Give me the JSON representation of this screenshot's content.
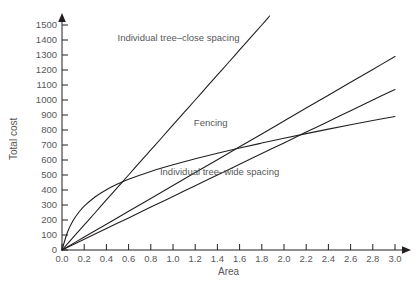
{
  "chart_data": {
    "type": "line",
    "title": "",
    "xlabel": "Area",
    "ylabel": "Total cost",
    "xlim": [
      0.0,
      3.0
    ],
    "ylim": [
      0,
      1500
    ],
    "grid": false,
    "legend_position": "inline-annotations",
    "xticks": [
      "0.0",
      "0.2",
      "0.4",
      "0.6",
      "0.8",
      "1.0",
      "1.2",
      "1.4",
      "1.6",
      "1.8",
      "2.0",
      "2.2",
      "2.4",
      "2.6",
      "2.8",
      "3.0"
    ],
    "xtick_values": [
      0.0,
      0.2,
      0.4,
      0.6,
      0.8,
      1.0,
      1.2,
      1.4,
      1.6,
      1.8,
      2.0,
      2.2,
      2.4,
      2.6,
      2.8,
      3.0
    ],
    "yticks": [
      "0",
      "100",
      "200",
      "300",
      "400",
      "500",
      "600",
      "700",
      "800",
      "900",
      "1000",
      "1100",
      "1200",
      "1300",
      "1400",
      "1500"
    ],
    "ytick_values": [
      0,
      100,
      200,
      300,
      400,
      500,
      600,
      700,
      800,
      900,
      1000,
      1100,
      1200,
      1300,
      1400,
      1500
    ],
    "line_color": "#231f20",
    "text_color": "#58585a",
    "series": [
      {
        "name": "Individual tree-close spacing",
        "label": "Individual tree–close spacing",
        "label_x": 1.05,
        "label_y": 1395,
        "x": [
          0.0,
          0.1,
          0.2,
          0.3,
          0.4,
          0.5,
          0.6,
          0.7,
          0.8,
          0.9,
          1.0,
          1.1,
          1.2,
          1.3,
          1.4,
          1.5,
          1.6,
          1.7,
          1.8,
          1.87
        ],
        "values": [
          0,
          84,
          167,
          250,
          334,
          417,
          500,
          584,
          667,
          750,
          834,
          917,
          1000,
          1084,
          1167,
          1250,
          1334,
          1417,
          1500,
          1560
        ]
      },
      {
        "name": "Fencing",
        "label": "Fencing",
        "label_x": 1.34,
        "label_y": 825,
        "x": [
          0.0,
          0.2,
          0.4,
          0.6,
          0.8,
          1.0,
          1.2,
          1.4,
          1.6,
          1.8,
          2.0,
          2.2,
          2.4,
          2.6,
          2.8,
          3.0
        ],
        "values": [
          0,
          86,
          172,
          258,
          344,
          430,
          516,
          602,
          688,
          774,
          860,
          946,
          1032,
          1118,
          1204,
          1290
        ]
      },
      {
        "name": "Individual tree-wide spacing",
        "label": "Individual tree–wide spacing",
        "label_x": 1.42,
        "label_y": 500,
        "x": [
          0.0,
          0.05,
          0.1,
          0.15,
          0.2,
          0.3,
          0.4,
          0.5,
          0.6,
          0.8,
          1.0,
          1.2,
          1.4,
          1.6,
          1.8,
          2.0,
          2.2,
          2.4,
          2.6,
          2.8,
          3.0
        ],
        "values": [
          0,
          120,
          196,
          250,
          292,
          355,
          402,
          440,
          472,
          524,
          568,
          608,
          645,
          680,
          713,
          745,
          776,
          806,
          835,
          863,
          890
        ]
      },
      {
        "name": "Individual tree-wide spacing lower",
        "label": "",
        "label_x": null,
        "label_y": null,
        "x": [
          0.0,
          0.2,
          0.4,
          0.6,
          0.8,
          1.0,
          1.2,
          1.4,
          1.6,
          1.8,
          2.0,
          2.2,
          2.4,
          2.6,
          2.8,
          3.0
        ],
        "values": [
          0,
          71,
          143,
          214,
          286,
          357,
          429,
          500,
          571,
          643,
          714,
          786,
          857,
          929,
          1000,
          1070
        ]
      }
    ],
    "intersections": [
      {
        "x": 0.58,
        "y": 465
      },
      {
        "x": 2.23,
        "y": 930
      }
    ]
  },
  "caption": {
    "text": ""
  }
}
